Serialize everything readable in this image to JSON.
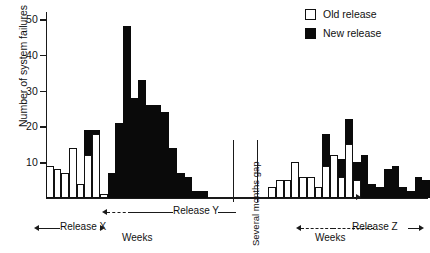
{
  "chart_data": {
    "type": "bar",
    "title": "",
    "subtitle": "",
    "xlabel": "Weeks",
    "ylabel": "Number of system failures",
    "ylim": [
      0,
      52
    ],
    "yticks": [
      10,
      20,
      30,
      40,
      50
    ],
    "ytick_labels": [
      "10",
      "20",
      "30",
      "40",
      "50"
    ],
    "grid": false,
    "stacked": true,
    "legend_position": "top-right",
    "legend": [
      {
        "key": "old",
        "label": "Old release",
        "color": "#ffffff",
        "edge": "#111111"
      },
      {
        "key": "new",
        "label": "New release",
        "color": "#0a0a0a",
        "edge": "#0a0a0a"
      }
    ],
    "series": [
      {
        "name": "Old release",
        "key": "old",
        "values": [
          9,
          8,
          7,
          14,
          4,
          12,
          18,
          1,
          0,
          0,
          0,
          0,
          0,
          0,
          0,
          0,
          0,
          0,
          0,
          0,
          0,
          0,
          0,
          0,
          0,
          3,
          5,
          5,
          10,
          6,
          6,
          3,
          9,
          12,
          6,
          15,
          5,
          0,
          0,
          0,
          0,
          0,
          0,
          0,
          0,
          0
        ]
      },
      {
        "name": "New release",
        "key": "new",
        "values": [
          0,
          0,
          0,
          0,
          0,
          7,
          1,
          0,
          7,
          21,
          48,
          28,
          33,
          26,
          26,
          24,
          14,
          7,
          6,
          2,
          2,
          0,
          0,
          0,
          0,
          0,
          0,
          0,
          0,
          0,
          0,
          0,
          9,
          0,
          5,
          7,
          5,
          12,
          4,
          3,
          8,
          9,
          3,
          2,
          6,
          5
        ]
      }
    ],
    "bar_count": 46,
    "gap_marker": {
      "label": "Several months gap",
      "after_bar_index": 24
    },
    "annotations": [
      {
        "text": "Release X",
        "style": "double-arrow",
        "from_bar": 0,
        "to_bar": 7
      },
      {
        "text": "Weeks",
        "style": "dashed-arrow-right",
        "from_bar": 7,
        "to_bar": 9
      },
      {
        "text": "Release Y",
        "style": "line-right",
        "from_bar": 9,
        "to_bar": 21
      },
      {
        "text": "Weeks",
        "style": "dashed-double-arrow",
        "from_bar": 30,
        "to_bar": 36
      },
      {
        "text": "Release Z",
        "style": "line-arrow-right",
        "from_bar": 36,
        "to_bar": 46
      }
    ]
  }
}
